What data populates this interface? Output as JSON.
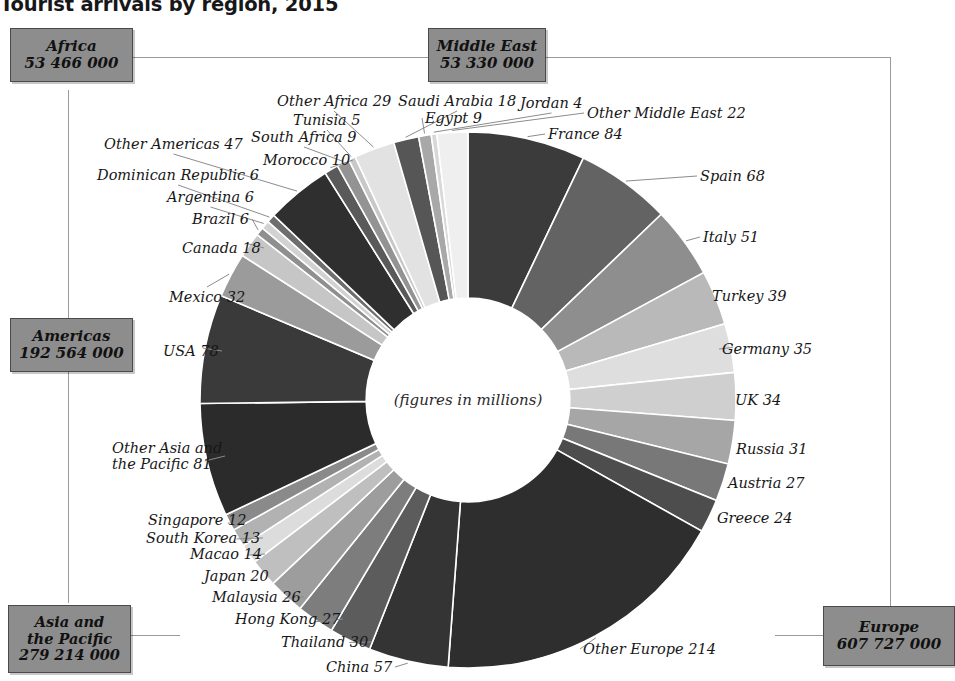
{
  "title": "Tourist arrivals by region, 2015",
  "center_note": "(figures in millions)",
  "colors": {
    "box_fill": "#8d8d8d",
    "box_border": "#4a4a4a",
    "leader": "#8c8c8c",
    "background": "#ffffff"
  },
  "regions": [
    {
      "key": "africa",
      "name": "Africa",
      "value": "53 466 000"
    },
    {
      "key": "middle_east",
      "name": "Middle East",
      "value": "53 330 000"
    },
    {
      "key": "americas",
      "name": "Americas",
      "value": "192 564 000"
    },
    {
      "key": "asia",
      "name": "Asia and\nthe Pacific",
      "value": "279 214 000"
    },
    {
      "key": "europe",
      "name": "Europe",
      "value": "607 727 000"
    }
  ],
  "chart_data": {
    "type": "pie",
    "title": "Tourist arrivals by region, 2015",
    "subtitle": "(figures in millions)",
    "unit": "millions of arrivals",
    "donut": true,
    "inner_radius_ratio": 0.38,
    "start_angle_deg": -90,
    "direction": "clockwise",
    "legend": "region boxes around chart",
    "group_totals": {
      "Europe": 607.727,
      "Asia and the Pacific": 279.214,
      "Americas": 192.564,
      "Africa": 53.466,
      "Middle East": 53.33
    },
    "labels": [
      "France 84",
      "Spain 68",
      "Italy 51",
      "Turkey 39",
      "Germany 35",
      "UK 34",
      "Russia 31",
      "Austria 27",
      "Greece 24",
      "Other Europe 214",
      "China 57",
      "Thailand 30",
      "Hong Kong 27",
      "Malaysia 26",
      "Japan 20",
      "Macao 14",
      "South Korea 13",
      "Singapore 12",
      "Other Asia and the Pacific 81",
      "USA 78",
      "Mexico 32",
      "Canada 18",
      "Brazil 6",
      "Argentina 6",
      "Dominican Republic 6",
      "Other Americas 47",
      "Morocco 10",
      "South Africa 9",
      "Tunisia 5",
      "Other Africa 29",
      "Saudi Arabia 18",
      "Egypt 9",
      "Jordan 4",
      "Other Middle East 22"
    ],
    "slices": [
      {
        "label": "France 84",
        "short": "France",
        "value": 84,
        "region": "Europe",
        "color": "#3b3b3b"
      },
      {
        "label": "Spain 68",
        "short": "Spain",
        "value": 68,
        "region": "Europe",
        "color": "#636363"
      },
      {
        "label": "Italy 51",
        "short": "Italy",
        "value": 51,
        "region": "Europe",
        "color": "#8e8e8e"
      },
      {
        "label": "Turkey 39",
        "short": "Turkey",
        "value": 39,
        "region": "Europe",
        "color": "#b9b9b9"
      },
      {
        "label": "Germany 35",
        "short": "Germany",
        "value": 35,
        "region": "Europe",
        "color": "#dedede"
      },
      {
        "label": "UK 34",
        "short": "UK",
        "value": 34,
        "region": "Europe",
        "color": "#cfcfcf"
      },
      {
        "label": "Russia 31",
        "short": "Russia",
        "value": 31,
        "region": "Europe",
        "color": "#a6a6a6"
      },
      {
        "label": "Austria 27",
        "short": "Austria",
        "value": 27,
        "region": "Europe",
        "color": "#787878"
      },
      {
        "label": "Greece 24",
        "short": "Greece",
        "value": 24,
        "region": "Europe",
        "color": "#4d4d4d"
      },
      {
        "label": "Other Europe 214",
        "short": "Other Europe",
        "value": 214,
        "region": "Europe",
        "color": "#2e2e2e"
      },
      {
        "label": "China 57",
        "short": "China",
        "value": 57,
        "region": "Asia and the Pacific",
        "color": "#343434"
      },
      {
        "label": "Thailand 30",
        "short": "Thailand",
        "value": 30,
        "region": "Asia and the Pacific",
        "color": "#5c5c5c"
      },
      {
        "label": "Hong Kong 27",
        "short": "Hong Kong",
        "value": 27,
        "region": "Asia and the Pacific",
        "color": "#7d7d7d"
      },
      {
        "label": "Malaysia 26",
        "short": "Malaysia",
        "value": 26,
        "region": "Asia and the Pacific",
        "color": "#9d9d9d"
      },
      {
        "label": "Japan 20",
        "short": "Japan",
        "value": 20,
        "region": "Asia and the Pacific",
        "color": "#bfbfbf"
      },
      {
        "label": "Macao 14",
        "short": "Macao",
        "value": 14,
        "region": "Asia and the Pacific",
        "color": "#dcdcdc"
      },
      {
        "label": "South Korea 13",
        "short": "South Korea",
        "value": 13,
        "region": "Asia and the Pacific",
        "color": "#b2b2b2"
      },
      {
        "label": "Singapore 12",
        "short": "Singapore",
        "value": 12,
        "region": "Asia and the Pacific",
        "color": "#8a8a8a"
      },
      {
        "label": "Other Asia and\nthe Pacific 81",
        "short": "Other Asia and the Pacific",
        "value": 81,
        "region": "Asia and the Pacific",
        "color": "#2b2b2b"
      },
      {
        "label": "USA 78",
        "short": "USA",
        "value": 78,
        "region": "Americas",
        "color": "#3a3a3a"
      },
      {
        "label": "Mexico 32",
        "short": "Mexico",
        "value": 32,
        "region": "Americas",
        "color": "#9b9b9b"
      },
      {
        "label": "Canada 18",
        "short": "Canada",
        "value": 18,
        "region": "Americas",
        "color": "#c6c6c6"
      },
      {
        "label": "Brazil 6",
        "short": "Brazil",
        "value": 6,
        "region": "Americas",
        "color": "#8f8f8f"
      },
      {
        "label": "Argentina 6",
        "short": "Argentina",
        "value": 6,
        "region": "Americas",
        "color": "#d2d2d2"
      },
      {
        "label": "Dominican Republic 6",
        "short": "Dominican Republic",
        "value": 6,
        "region": "Americas",
        "color": "#6e6e6e"
      },
      {
        "label": "Other Americas 47",
        "short": "Other Americas",
        "value": 47,
        "region": "Americas",
        "color": "#2f2f2f"
      },
      {
        "label": "Morocco 10",
        "short": "Morocco",
        "value": 10,
        "region": "Africa",
        "color": "#5a5a5a"
      },
      {
        "label": "South Africa 9",
        "short": "South Africa",
        "value": 9,
        "region": "Africa",
        "color": "#939393"
      },
      {
        "label": "Tunisia 5",
        "short": "Tunisia",
        "value": 5,
        "region": "Africa",
        "color": "#c8c8c8"
      },
      {
        "label": "Other Africa 29",
        "short": "Other Africa",
        "value": 29,
        "region": "Africa",
        "color": "#e2e2e2"
      },
      {
        "label": "Saudi Arabia 18",
        "short": "Saudi Arabia",
        "value": 18,
        "region": "Middle East",
        "color": "#565656"
      },
      {
        "label": "Egypt 9",
        "short": "Egypt",
        "value": 9,
        "region": "Middle East",
        "color": "#a8a8a8"
      },
      {
        "label": "Jordan 4",
        "short": "Jordan",
        "value": 4,
        "region": "Middle East",
        "color": "#d8d8d8"
      },
      {
        "label": "Other Middle East 22",
        "short": "Other Middle East",
        "value": 22,
        "region": "Middle East",
        "color": "#efefef"
      }
    ]
  },
  "label_layout": [
    {
      "label": "France 84",
      "x": 548,
      "y": 126,
      "align": "rt"
    },
    {
      "label": "Spain 68",
      "x": 700,
      "y": 168,
      "align": "rt"
    },
    {
      "label": "Italy 51",
      "x": 703,
      "y": 229,
      "align": "rt"
    },
    {
      "label": "Turkey 39",
      "x": 712,
      "y": 288,
      "align": "rt"
    },
    {
      "label": "Germany 35",
      "x": 722,
      "y": 341,
      "align": "rt"
    },
    {
      "label": "UK 34",
      "x": 735,
      "y": 392,
      "align": "rt"
    },
    {
      "label": "Russia 31",
      "x": 736,
      "y": 441,
      "align": "rt"
    },
    {
      "label": "Austria 27",
      "x": 728,
      "y": 475,
      "align": "rt"
    },
    {
      "label": "Greece 24",
      "x": 717,
      "y": 510,
      "align": "rt"
    },
    {
      "label": "Other Europe 214",
      "x": 583,
      "y": 641,
      "align": "rt"
    },
    {
      "label": "China 57",
      "x": 326,
      "y": 659,
      "align": "rt"
    },
    {
      "label": "Thailand 30",
      "x": 281,
      "y": 634,
      "align": "rt"
    },
    {
      "label": "Hong Kong 27",
      "x": 235,
      "y": 611,
      "align": "rt"
    },
    {
      "label": "Malaysia 26",
      "x": 212,
      "y": 589,
      "align": "rt"
    },
    {
      "label": "Japan 20",
      "x": 204,
      "y": 568,
      "align": "rt"
    },
    {
      "label": "Macao 14",
      "x": 190,
      "y": 546,
      "align": "rt"
    },
    {
      "label": "South Korea 13",
      "x": 146,
      "y": 530,
      "align": "rt"
    },
    {
      "label": "Singapore 12",
      "x": 148,
      "y": 512,
      "align": "rt"
    },
    {
      "label": "Other Asia and\nthe Pacific 81",
      "x": 112,
      "y": 440,
      "align": "rt"
    },
    {
      "label": "USA 78",
      "x": 163,
      "y": 343,
      "align": "rt"
    },
    {
      "label": "Mexico 32",
      "x": 169,
      "y": 289,
      "align": "rt"
    },
    {
      "label": "Canada 18",
      "x": 182,
      "y": 240,
      "align": "rt"
    },
    {
      "label": "Brazil 6",
      "x": 192,
      "y": 211,
      "align": "rt"
    },
    {
      "label": "Argentina 6",
      "x": 167,
      "y": 189,
      "align": "rt"
    },
    {
      "label": "Dominican Republic 6",
      "x": 97,
      "y": 167,
      "align": "rt"
    },
    {
      "label": "Other Americas 47",
      "x": 104,
      "y": 136,
      "align": "rt"
    },
    {
      "label": "Morocco 10",
      "x": 263,
      "y": 152,
      "align": "rt"
    },
    {
      "label": "South Africa 9",
      "x": 251,
      "y": 129,
      "align": "rt"
    },
    {
      "label": "Tunisia 5",
      "x": 293,
      "y": 112,
      "align": "rt"
    },
    {
      "label": "Other Africa 29",
      "x": 277,
      "y": 93,
      "align": "rt"
    },
    {
      "label": "Saudi Arabia 18",
      "x": 398,
      "y": 93,
      "align": "rt"
    },
    {
      "label": "Egypt 9",
      "x": 425,
      "y": 110,
      "align": "rt"
    },
    {
      "label": "Jordan 4",
      "x": 520,
      "y": 95,
      "align": "rt"
    },
    {
      "label": "Other Middle East 22",
      "x": 587,
      "y": 105,
      "align": "rt"
    }
  ]
}
